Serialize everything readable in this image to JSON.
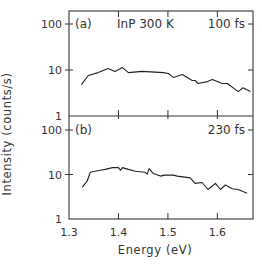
{
  "chart_data": [
    {
      "type": "line",
      "panel_label": "(a)",
      "annotation_sample": "InP 300 K",
      "annotation_delay": "100 fs",
      "xlabel": "Energy (eV)",
      "ylabel": "Intensity (counts/s)",
      "yscale": "log",
      "xlim": [
        1.3,
        1.672
      ],
      "ylim": [
        1,
        150
      ],
      "y_ticks": [
        1,
        10,
        100
      ],
      "y_tick_labels": [
        "1",
        "10",
        "100"
      ],
      "x_ticks": [
        1.3,
        1.4,
        1.5,
        1.6
      ],
      "grid": false,
      "series": [
        {
          "name": "100 fs",
          "x": [
            1.325,
            1.339,
            1.359,
            1.379,
            1.393,
            1.408,
            1.42,
            1.448,
            1.491,
            1.501,
            1.511,
            1.529,
            1.549,
            1.555,
            1.561,
            1.58,
            1.59,
            1.61,
            1.62,
            1.642,
            1.652,
            1.667
          ],
          "y": [
            4.8,
            7.6,
            8.8,
            10.8,
            9.3,
            11.3,
            8.8,
            9.3,
            8.8,
            8.4,
            6.9,
            8.0,
            5.9,
            5.9,
            5.1,
            5.6,
            6.2,
            5.1,
            5.1,
            3.4,
            4.1,
            3.4
          ]
        }
      ]
    },
    {
      "type": "line",
      "panel_label": "(b)",
      "annotation_delay": "230 fs",
      "xlabel": "Energy (eV)",
      "ylabel": "Intensity (counts/s)",
      "yscale": "log",
      "xlim": [
        1.3,
        1.672
      ],
      "ylim": [
        1,
        150
      ],
      "y_ticks": [
        1,
        10,
        100
      ],
      "y_tick_labels": [
        "1",
        "10",
        "100"
      ],
      "x_ticks": [
        1.3,
        1.4,
        1.5,
        1.6
      ],
      "x_tick_labels": [
        "1.3",
        "1.4",
        "1.5",
        "1.6"
      ],
      "grid": false,
      "series": [
        {
          "name": "230 fs",
          "x": [
            1.327,
            1.337,
            1.343,
            1.353,
            1.363,
            1.373,
            1.388,
            1.4,
            1.404,
            1.408,
            1.42,
            1.434,
            1.454,
            1.458,
            1.462,
            1.47,
            1.485,
            1.493,
            1.511,
            1.519,
            1.545,
            1.555,
            1.569,
            1.581,
            1.596,
            1.606,
            1.616,
            1.63,
            1.642,
            1.66
          ],
          "y": [
            5.2,
            7.2,
            11.2,
            11.8,
            12.4,
            13.0,
            14.3,
            14.3,
            12.4,
            14.3,
            13.0,
            11.8,
            11.2,
            10.2,
            13.6,
            10.6,
            9.2,
            9.7,
            9.7,
            9.2,
            8.4,
            6.3,
            6.6,
            4.6,
            6.3,
            4.6,
            5.8,
            4.8,
            4.6,
            3.8
          ]
        }
      ]
    }
  ],
  "labels": {
    "xlabel": "Energy (eV)",
    "ylabel": "Intensity (counts/s)"
  }
}
